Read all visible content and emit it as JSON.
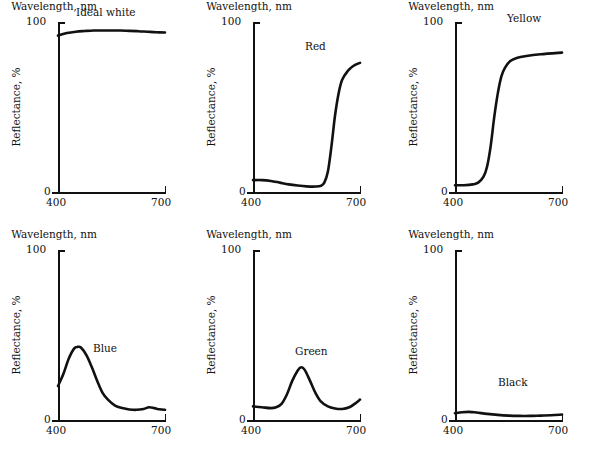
{
  "figure": {
    "axis_titles": {
      "x": "Wavelength, nm",
      "y": "Reflectance, %"
    },
    "x_ticks": [
      "400",
      "700"
    ],
    "y_ticks": [
      "100",
      "0"
    ]
  },
  "chart_data": [
    {
      "type": "line",
      "title": "Ideal white",
      "xlabel": "Wavelength, nm",
      "ylabel": "Reflectance, %",
      "xlim": [
        400,
        700
      ],
      "ylim": [
        0,
        100
      ],
      "grid": false,
      "label_position": "top-center",
      "x": [
        400,
        425,
        450,
        475,
        500,
        525,
        550,
        575,
        600,
        625,
        650,
        675,
        700
      ],
      "values": [
        92,
        93.5,
        94.3,
        94.7,
        95,
        95,
        95,
        95,
        94.8,
        94.6,
        94.3,
        94,
        93.8
      ]
    },
    {
      "type": "line",
      "title": "Red",
      "xlabel": "Wavelength, nm",
      "ylabel": "Reflectance, %",
      "xlim": [
        400,
        700
      ],
      "ylim": [
        0,
        100
      ],
      "grid": false,
      "label_position": "upper-center",
      "x": [
        400,
        425,
        450,
        475,
        500,
        525,
        550,
        575,
        590,
        600,
        610,
        620,
        630,
        640,
        650,
        665,
        680,
        700
      ],
      "values": [
        7,
        7,
        6.5,
        5.5,
        4.5,
        3.8,
        3.3,
        3.2,
        3.6,
        5.5,
        12,
        27,
        45,
        58,
        66,
        71,
        74,
        76
      ]
    },
    {
      "type": "line",
      "title": "Yellow",
      "xlabel": "Wavelength, nm",
      "ylabel": "Reflectance, %",
      "xlim": [
        400,
        700
      ],
      "ylim": [
        0,
        100
      ],
      "grid": false,
      "label_position": "upper-center",
      "x": [
        400,
        425,
        450,
        465,
        480,
        490,
        500,
        510,
        520,
        530,
        540,
        555,
        575,
        600,
        640,
        700
      ],
      "values": [
        4,
        4,
        4.5,
        5.5,
        9,
        15,
        27,
        44,
        58,
        68,
        73,
        77,
        79,
        80,
        81,
        82
      ]
    },
    {
      "type": "line",
      "title": "Blue",
      "xlabel": "Wavelength, nm",
      "ylabel": "Reflectance, %",
      "xlim": [
        400,
        700
      ],
      "ylim": [
        0,
        100
      ],
      "grid": false,
      "label_position": "middle-right-of-peak",
      "x": [
        400,
        415,
        430,
        445,
        455,
        465,
        480,
        495,
        510,
        525,
        540,
        560,
        580,
        600,
        620,
        640,
        655,
        670,
        685,
        700
      ],
      "values": [
        20,
        27,
        36,
        42,
        43,
        42.5,
        38,
        31,
        23,
        16,
        12,
        8.5,
        7,
        6.2,
        6,
        6.5,
        7.5,
        7,
        6.3,
        6
      ]
    },
    {
      "type": "line",
      "title": "Green",
      "xlabel": "Wavelength, nm",
      "ylabel": "Reflectance, %",
      "xlim": [
        400,
        700
      ],
      "ylim": [
        0,
        100
      ],
      "grid": false,
      "label_position": "above-peak",
      "x": [
        400,
        425,
        450,
        465,
        480,
        495,
        510,
        525,
        535,
        545,
        560,
        575,
        590,
        610,
        630,
        650,
        670,
        685,
        700
      ],
      "values": [
        8,
        7.5,
        7,
        7.5,
        9.5,
        15,
        23,
        29,
        31,
        29.5,
        23,
        16,
        11,
        8,
        6.8,
        6.5,
        7.5,
        9.5,
        12
      ]
    },
    {
      "type": "line",
      "title": "Black",
      "xlabel": "Wavelength, nm",
      "ylabel": "Reflectance, %",
      "xlim": [
        0,
        100
      ],
      "ylim": [
        0,
        100
      ],
      "grid": false,
      "label_position": "above-curve",
      "x": [
        400,
        420,
        440,
        460,
        490,
        520,
        550,
        580,
        610,
        640,
        670,
        700
      ],
      "values": [
        4,
        4.6,
        4.8,
        4.4,
        3.6,
        3,
        2.6,
        2.4,
        2.4,
        2.6,
        2.8,
        3.2
      ]
    }
  ]
}
